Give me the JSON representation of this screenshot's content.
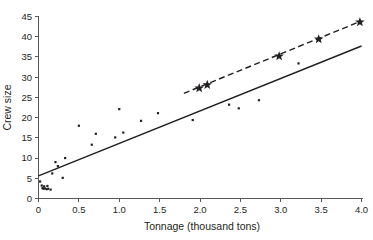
{
  "chart_data": {
    "type": "scatter",
    "title": "",
    "xlabel": "Tonnage (thousand tons)",
    "ylabel": "Crew size",
    "xlim": [
      0,
      4.0
    ],
    "ylim": [
      0,
      45
    ],
    "xticks": [
      "0",
      "0.5",
      "1.0",
      "1.5",
      "2.0",
      "2.5",
      "3.0",
      "3.5",
      "4.0"
    ],
    "xtick_values": [
      0,
      0.5,
      1.0,
      1.5,
      2.0,
      2.5,
      3.0,
      3.5,
      4.0
    ],
    "yticks": [
      "0",
      "5",
      "10",
      "15",
      "20",
      "25",
      "30",
      "35",
      "40",
      "45"
    ],
    "ytick_values": [
      0,
      5,
      10,
      15,
      20,
      25,
      30,
      35,
      40,
      45
    ],
    "grid": false,
    "legend": "none",
    "series": [
      {
        "name": "ships",
        "marker": "small-square-dot",
        "points": [
          [
            0.02,
            4.2
          ],
          [
            0.04,
            3.2
          ],
          [
            0.05,
            2.6
          ],
          [
            0.06,
            2.4
          ],
          [
            0.07,
            3.0
          ],
          [
            0.08,
            2.5
          ],
          [
            0.1,
            2.3
          ],
          [
            0.11,
            3.1
          ],
          [
            0.12,
            2.4
          ],
          [
            0.15,
            2.2
          ],
          [
            0.17,
            6.2
          ],
          [
            0.21,
            9.0
          ],
          [
            0.24,
            8.0
          ],
          [
            0.3,
            5.1
          ],
          [
            0.33,
            10.0
          ],
          [
            0.5,
            18.0
          ],
          [
            0.66,
            13.3
          ],
          [
            0.71,
            16.0
          ],
          [
            0.95,
            15.1
          ],
          [
            1.0,
            22.1
          ],
          [
            1.05,
            16.3
          ],
          [
            1.27,
            19.2
          ],
          [
            1.48,
            21.1
          ],
          [
            1.91,
            19.4
          ],
          [
            2.36,
            23.2
          ],
          [
            2.48,
            22.3
          ],
          [
            2.73,
            24.3
          ],
          [
            3.22,
            33.4
          ]
        ]
      },
      {
        "name": "large-vessels",
        "marker": "star",
        "points": [
          [
            1.99,
            27.3
          ],
          [
            2.09,
            28.1
          ],
          [
            2.98,
            35.2
          ],
          [
            3.47,
            39.4
          ],
          [
            3.98,
            43.6
          ]
        ]
      }
    ],
    "lines": [
      {
        "name": "overall-regression",
        "style": "solid",
        "x1": 0.0,
        "y1": 5.6,
        "x2": 4.0,
        "y2": 37.7
      },
      {
        "name": "large-vessel-regression",
        "style": "dashed",
        "x1": 1.8,
        "y1": 26.0,
        "x2": 4.0,
        "y2": 43.9
      }
    ]
  }
}
